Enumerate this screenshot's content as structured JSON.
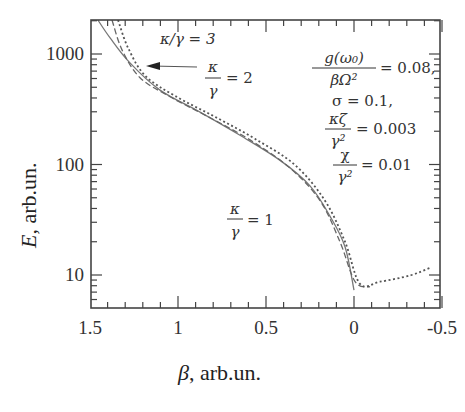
{
  "chart_data": {
    "type": "line",
    "title": "",
    "xlabel": "β, arb.un.",
    "ylabel": "E, arb.un.",
    "xlim": [
      1.5,
      -0.5
    ],
    "ylim": [
      6.5,
      2000
    ],
    "yscale": "log",
    "x_reversed": true,
    "grid": false,
    "x_ticks": [
      1.5,
      1,
      0.5,
      0,
      -0.5
    ],
    "x_tick_labels": [
      "1.5",
      "1",
      "0.5",
      "0",
      "-0.5"
    ],
    "y_ticks": [
      10,
      100,
      1000
    ],
    "y_tick_labels": [
      "10",
      "100",
      "1000"
    ],
    "series": [
      {
        "name": "κ/γ = 1",
        "style": "solid",
        "x": [
          1.455,
          1.386,
          1.273,
          1.102,
          0.875,
          0.648,
          0.42,
          0.25,
          0.136,
          0.051,
          0.0
        ],
        "y": [
          2030,
          1400,
          830,
          471,
          298,
          184,
          109,
          64,
          34,
          18,
          7.3
        ]
      },
      {
        "name": "κ/γ = 2",
        "style": "dashed",
        "x": [
          1.375,
          1.318,
          1.216,
          1.045,
          0.818,
          0.591,
          0.364,
          0.193,
          0.08,
          -0.006,
          -0.091
        ],
        "y": [
          2030,
          1090,
          610,
          410,
          265,
          167,
          93,
          47,
          20,
          8.7,
          7.8
        ]
      },
      {
        "name": "κ/γ = 3",
        "style": "dotted",
        "x": [
          1.341,
          1.284,
          1.188,
          1.017,
          0.79,
          0.563,
          0.335,
          0.165,
          0.051,
          -0.034,
          -0.148,
          -0.318,
          -0.432
        ],
        "y": [
          2030,
          1140,
          640,
          418,
          270,
          171,
          99,
          47,
          20,
          8.3,
          8.7,
          9.9,
          11.6
        ]
      }
    ],
    "annotations": [
      {
        "text": "κ/γ = 3",
        "pos": "top-center, arrow pointing to dotted curve"
      },
      {
        "text": "κ/γ = 2",
        "pos": "top-center below κ/γ=3"
      },
      {
        "text": "κ/γ = 1",
        "pos": "middle-lower"
      },
      {
        "text": "g(ω0)/(βΩ²) = 0.08,",
        "pos": "upper-right"
      },
      {
        "text": "σ = 0.1,",
        "pos": "upper-right"
      },
      {
        "text": "κζ/γ² = 0.003",
        "pos": "upper-right"
      },
      {
        "text": "χ/γ² = 0.01",
        "pos": "upper-right"
      }
    ]
  },
  "labels": {
    "xlabel_sym": "β",
    "xlabel_rest": ", arb.un.",
    "ylabel_sym": "E",
    "ylabel_rest": ", arb.un.",
    "k3": "κ/γ = 3",
    "k2_num": "κ",
    "k2_den": "γ",
    "k2_rest": "= 2",
    "k1_num": "κ",
    "k1_den": "γ",
    "k1_rest": "= 1",
    "p1_num": "g(ω₀)",
    "p1_den": "βΩ²",
    "p1_rest": "= 0.08,",
    "p2": "σ = 0.1,",
    "p3_num": "κζ",
    "p3_den": "γ²",
    "p3_rest": "= 0.003",
    "p4_num": "χ",
    "p4_den": "γ²",
    "p4_rest": "= 0.01"
  },
  "colors": {
    "axis": "#444444",
    "solid": "#777777",
    "dashed": "#666666",
    "dotted": "#555555",
    "text": "#333333"
  }
}
